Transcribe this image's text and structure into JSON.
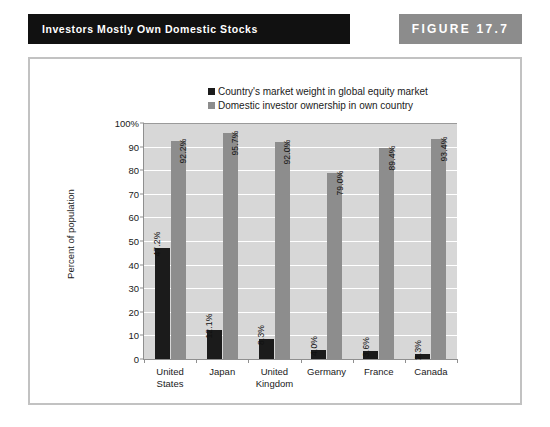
{
  "header": {
    "title": "Investors Mostly Own Domestic Stocks",
    "figure_label": "FIGURE  17.7",
    "title_bg": "#111111",
    "figure_bg": "#8c8c8c"
  },
  "chart_data": {
    "type": "bar",
    "title": "",
    "xlabel": "",
    "ylabel": "Percent of population",
    "ylim": [
      0,
      100
    ],
    "ytick_labels": [
      "100%",
      "90",
      "80",
      "70",
      "60",
      "50",
      "40",
      "30",
      "20",
      "10",
      "0"
    ],
    "ytick_values": [
      100,
      90,
      80,
      70,
      60,
      50,
      40,
      30,
      20,
      10,
      0
    ],
    "grid": true,
    "legend_position": "top-center",
    "categories": [
      "United States",
      "Japan",
      "United Kingdom",
      "Germany",
      "France",
      "Canada"
    ],
    "category_lines": [
      [
        "United",
        "States"
      ],
      [
        "Japan"
      ],
      [
        "United",
        "Kingdom"
      ],
      [
        "Germany"
      ],
      [
        "France"
      ],
      [
        "Canada"
      ]
    ],
    "series": [
      {
        "name": "Country's market weight in global equity market",
        "color": "#1b1b1b",
        "values": [
          47.2,
          12.1,
          8.3,
          4.0,
          3.6,
          2.3
        ],
        "labels": [
          "47.2%",
          "12.1%",
          "8.3%",
          "4.0%",
          "3.6%",
          "2.3%"
        ]
      },
      {
        "name": "Domestic investor ownership in own country",
        "color": "#8d8d8d",
        "values": [
          92.2,
          95.7,
          92.0,
          79.0,
          89.4,
          93.4
        ],
        "labels": [
          "92.2%",
          "95.7%",
          "92.0%",
          "79.0%",
          "89.4%",
          "93.4%"
        ]
      }
    ],
    "plot_bg": "#d7d7d7"
  }
}
